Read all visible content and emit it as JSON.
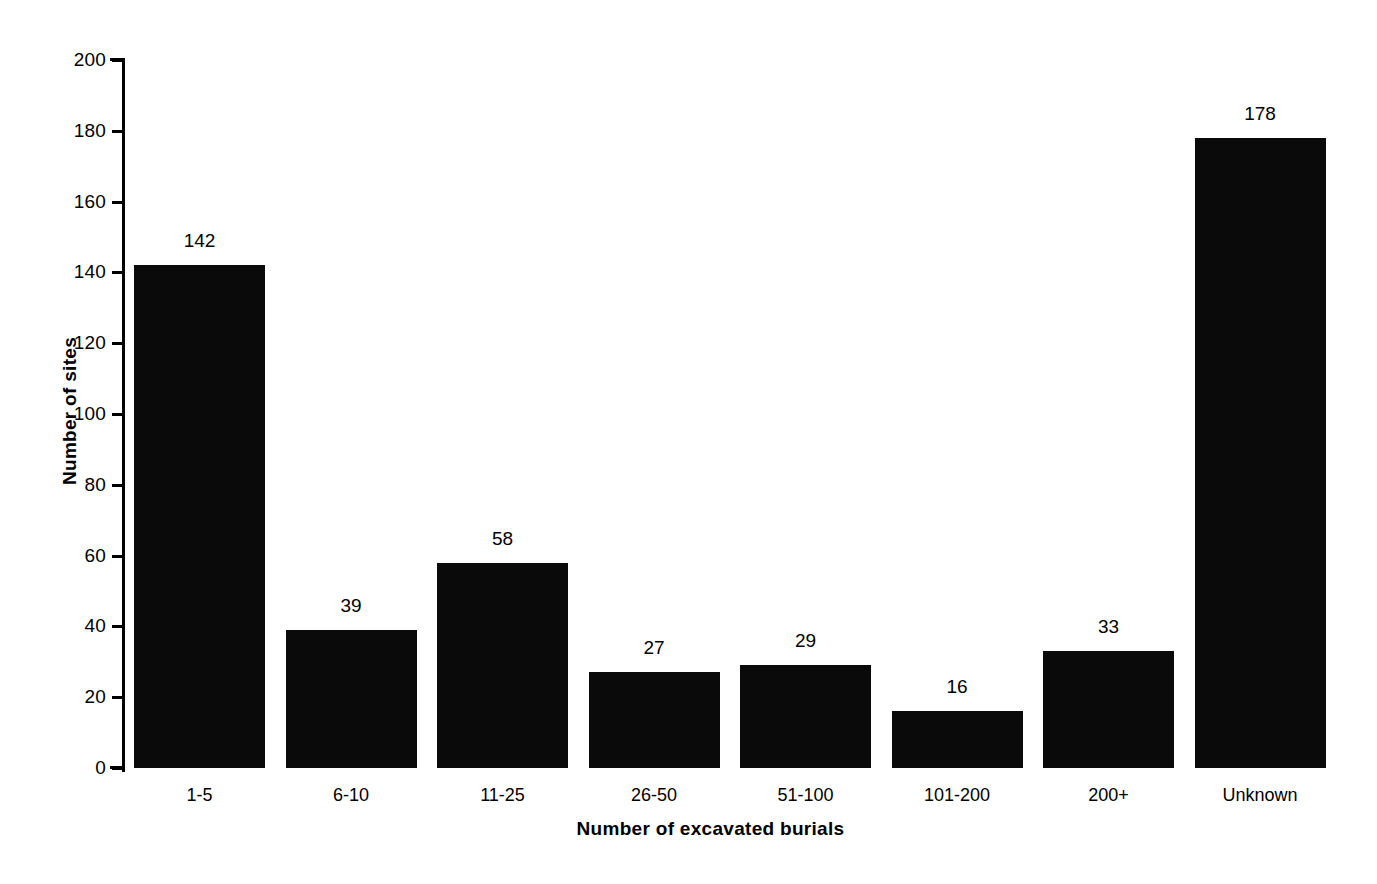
{
  "chart_data": {
    "type": "bar",
    "title": "",
    "subtitle": "",
    "xlabel": "Number of excavated burials",
    "ylabel": "Number of sites",
    "categories": [
      "1-5",
      "6-10",
      "11-25",
      "26-50",
      "51-100",
      "101-200",
      "200+",
      "Unknown"
    ],
    "values": [
      142,
      39,
      58,
      27,
      29,
      16,
      33,
      178
    ],
    "data_labels": [
      "142",
      "39",
      "58",
      "27",
      "29",
      "16",
      "33",
      "178"
    ],
    "ylim": [
      0,
      200
    ],
    "ytick_step": 20,
    "ytick_labels": [
      "200",
      "180",
      "160",
      "140",
      "120",
      "100",
      "80",
      "60",
      "40",
      "20",
      "0"
    ],
    "grid": false,
    "legend": false,
    "legend_position": "none",
    "bar_color": "#0a0a0a",
    "axis_color": "#000000",
    "background_color": "#ffffff",
    "annotations": []
  },
  "axes": {
    "y_title": "Number of sites",
    "x_title": "Number of excavated burials"
  }
}
